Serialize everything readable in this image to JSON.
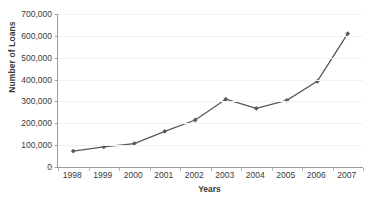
{
  "chart_data": {
    "type": "line",
    "title": "",
    "xlabel": "Years",
    "ylabel": "Number of Loans",
    "categories": [
      "1998",
      "1999",
      "2000",
      "2001",
      "2002",
      "2003",
      "2004",
      "2005",
      "2006",
      "2007"
    ],
    "values": [
      73000,
      92000,
      107000,
      163000,
      215000,
      310000,
      268000,
      305000,
      392000,
      610000
    ],
    "series": [
      {
        "name": "Number of Loans",
        "values": [
          73000,
          92000,
          107000,
          163000,
          215000,
          310000,
          268000,
          305000,
          392000,
          610000
        ]
      }
    ],
    "ylim": [
      0,
      700000
    ],
    "ytick_values": [
      0,
      100000,
      200000,
      300000,
      400000,
      500000,
      600000,
      700000
    ],
    "ytick_labels": [
      "0",
      "100,000",
      "200,000",
      "300,000",
      "400,000",
      "500,000",
      "600,000",
      "700,000"
    ],
    "grid": true,
    "grid_axis": "y",
    "legend": false,
    "legend_position": "none",
    "marker": "diamond",
    "line_color": "#595959",
    "marker_color": "#595959",
    "gridline_color": "#f1f1f1",
    "axis_color": "#9a9a9a",
    "background_color": "#ffffff"
  }
}
